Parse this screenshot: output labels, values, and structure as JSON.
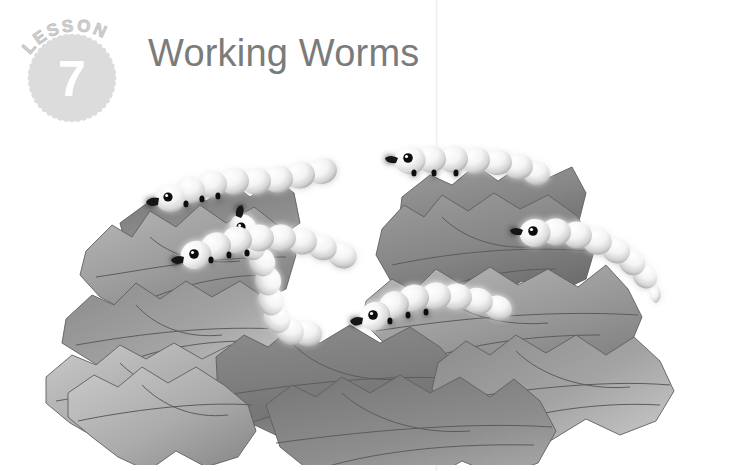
{
  "page": {
    "background_color": "#ffffff",
    "fold_line": {
      "visible": true,
      "x": 436
    }
  },
  "badge": {
    "arc_label": "LESSON",
    "number": "7",
    "shape": "scalloped-circle",
    "fill_color": "#dcdcdc",
    "number_color": "#ffffff",
    "arc_text_color": "#d2d2d2"
  },
  "header": {
    "title": "Working Worms",
    "title_color": "#7b7b7b"
  },
  "illustration": {
    "name": "worms-on-leaves",
    "palette": {
      "leaf_dark": "#6f6f6f",
      "leaf_mid": "#8f8f8f",
      "leaf_light": "#b4b4b4",
      "leaf_pale": "#c9c9c9",
      "vein": "#5e5e5e",
      "worm_body": "#f2f2f2",
      "worm_shade": "#b9b9b9",
      "worm_detail": "#111111"
    },
    "leaf_count": 11,
    "worm_count": 6,
    "worms": [
      {
        "id": "worm-upper-left",
        "segments": 8,
        "facing": "left"
      },
      {
        "id": "worm-center-climb",
        "segments": 8,
        "facing": "up"
      },
      {
        "id": "worm-upper-right",
        "segments": 7,
        "facing": "left"
      },
      {
        "id": "worm-mid-left",
        "segments": 8,
        "facing": "right"
      },
      {
        "id": "worm-mid-right",
        "segments": 8,
        "facing": "left"
      },
      {
        "id": "worm-lower-center",
        "segments": 8,
        "facing": "left"
      }
    ]
  }
}
